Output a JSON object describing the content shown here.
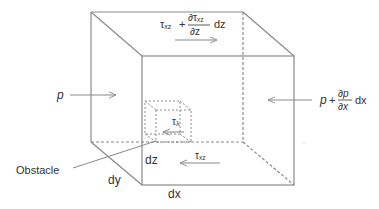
{
  "diagram": {
    "colors": {
      "line": "#8a8a8a",
      "dashed": "#8a8a8a",
      "text": "#333333",
      "background": "#ffffff"
    },
    "labels": {
      "top_stress": {
        "tau": "τ",
        "sub": "xz",
        "plus": "+",
        "partial_num": "∂τ",
        "partial_num_sub": "xz",
        "partial_den": "∂z",
        "dz": "dz"
      },
      "left_pressure": "p",
      "right_pressure": {
        "p": "p",
        "plus": "+",
        "partial_num": "∂p",
        "partial_den": "∂x",
        "dx": "dx"
      },
      "obstacle_stress": {
        "tau": "τ",
        "sub": "λ"
      },
      "bottom_stress": {
        "tau": "τ",
        "sub": "xz"
      },
      "obstacle": "Obstacle",
      "dz": "dz",
      "dy": "dy",
      "dx": "dx"
    }
  }
}
